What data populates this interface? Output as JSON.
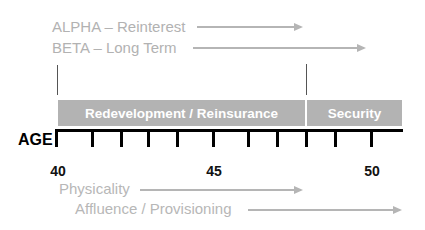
{
  "diagram": {
    "top_arrows": [
      {
        "label": "ALPHA – Reinterest",
        "arrow_start_x": 197,
        "arrow_end_x": 303
      },
      {
        "label": "BETA – Long Term",
        "arrow_start_x": 193,
        "arrow_end_x": 366
      }
    ],
    "segments": [
      {
        "label": "Redevelopment / Reinsurance",
        "start_age": 40,
        "end_age": 48
      },
      {
        "label": "Security",
        "start_age": 48,
        "end_age": 51
      }
    ],
    "axis": {
      "title": "AGE",
      "tick_labels": [
        {
          "value": "40",
          "x": 57
        },
        {
          "value": "45",
          "x": 214
        },
        {
          "value": "50",
          "x": 372
        }
      ],
      "tick_count": 11
    },
    "bottom_arrows": [
      {
        "label": "Physicality",
        "arrow_start_x": 140,
        "arrow_end_x": 303
      },
      {
        "label": "Affluence / Provisioning",
        "arrow_start_x": 248,
        "arrow_end_x": 402
      }
    ],
    "colors": {
      "label_gray": "#b2b2b2",
      "bar_gray": "#b3b3b3",
      "axis": "#000000"
    }
  }
}
